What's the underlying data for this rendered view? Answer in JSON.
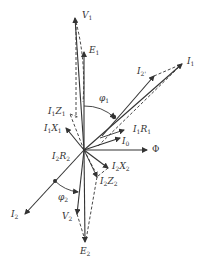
{
  "diagram": {
    "type": "phasor-diagram",
    "colors": {
      "line": "#333333",
      "background": "#ffffff"
    },
    "labels": {
      "V1": {
        "main": "V",
        "sub": "1"
      },
      "E1": {
        "main": "E",
        "sub": "1"
      },
      "I1": {
        "main": "I",
        "sub": "1"
      },
      "I2p": {
        "main": "I",
        "sub": "2'"
      },
      "phi1": {
        "main": "φ",
        "sub": "1"
      },
      "I1Z1": {
        "main": "I",
        "sub": "1",
        "main2": "Z",
        "sub2": "1"
      },
      "I1X1": {
        "main": "I",
        "sub": "1",
        "main2": "X",
        "sub2": "1"
      },
      "I1R1": {
        "main": "I",
        "sub": "1",
        "main2": "R",
        "sub2": "1"
      },
      "I0": {
        "main": "I",
        "sub": "0"
      },
      "Phi": {
        "main": "Φ"
      },
      "I2R2": {
        "main": "I",
        "sub": "2",
        "main2": "R",
        "sub2": "2"
      },
      "I2X2": {
        "main": "I",
        "sub": "2",
        "main2": "X",
        "sub2": "2"
      },
      "I2Z2": {
        "main": "I",
        "sub": "2",
        "main2": "Z",
        "sub2": "2"
      },
      "phi2": {
        "main": "φ",
        "sub": "2"
      },
      "I2": {
        "main": "I",
        "sub": "2"
      },
      "V2": {
        "main": "V",
        "sub": "2"
      },
      "E2": {
        "main": "E",
        "sub": "2"
      }
    }
  }
}
